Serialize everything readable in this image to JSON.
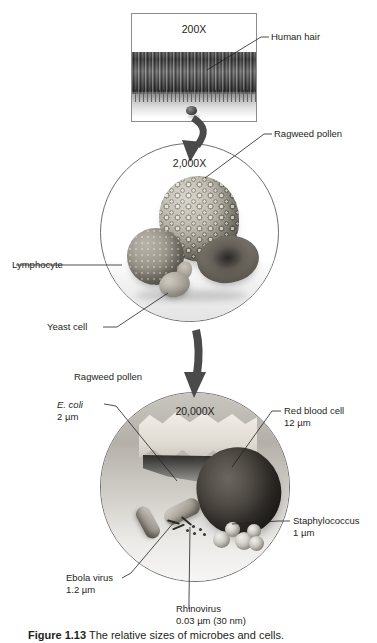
{
  "figure": {
    "caption_label": "Figure 1.13",
    "caption_text": "The relative sizes of microbes and cells."
  },
  "stages": [
    {
      "id": "200x",
      "magnification": "200X",
      "type": "micrograph-panel",
      "labels": [
        {
          "name": "human-hair",
          "text": "Human hair",
          "size": ""
        }
      ]
    },
    {
      "id": "2000x",
      "magnification": "2,000X",
      "type": "circle",
      "labels": [
        {
          "name": "ragweed-pollen",
          "text": "Ragweed pollen",
          "size": ""
        },
        {
          "name": "lymphocyte",
          "text": "Lymphocyte",
          "size": ""
        },
        {
          "name": "yeast-cell",
          "text": "Yeast cell",
          "size": ""
        }
      ]
    },
    {
      "id": "20000x",
      "magnification": "20,000X",
      "type": "circle",
      "labels": [
        {
          "name": "ragweed-pollen",
          "text": "Ragweed pollen",
          "size": ""
        },
        {
          "name": "e-coli",
          "text": "E. coli",
          "size": "2 µm",
          "italic": true
        },
        {
          "name": "red-blood-cell",
          "text": "Red blood cell",
          "size": "12 µm"
        },
        {
          "name": "staphylococcus",
          "text": "Staphylococcus",
          "size": "1 µm"
        },
        {
          "name": "ebola-virus",
          "text": "Ebola virus",
          "size": "1.2 µm"
        },
        {
          "name": "rhinovirus",
          "text": "Rhinovirus",
          "size": "0.03 µm (30 nm)"
        }
      ]
    }
  ],
  "labels": {
    "human_hair": "Human hair",
    "ragweed_pollen_top": "Ragweed pollen",
    "lymphocyte": "Lymphocyte",
    "yeast_cell": "Yeast cell",
    "ragweed_pollen_bottom": "Ragweed pollen",
    "ecoli_name": "E. coli",
    "ecoli_size": "2 µm",
    "rbc_name": "Red blood cell",
    "rbc_size": "12 µm",
    "staph_name": "Staphylococcus",
    "staph_size": "1 µm",
    "ebola_name": "Ebola virus",
    "ebola_size": "1.2 µm",
    "rhino_name": "Rhinovirus",
    "rhino_size": "0.03 µm (30 nm)"
  },
  "magnifications": {
    "first": "200X",
    "second": "2,000X",
    "third": "20,000X"
  },
  "colors": {
    "ink": "#231f20",
    "rule": "#6f6f6f",
    "arrow": "#4a4a4a"
  }
}
